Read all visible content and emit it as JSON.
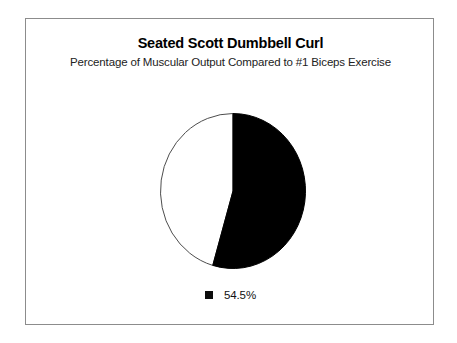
{
  "chart": {
    "title": "Seated Scott Dumbbell Curl",
    "subtitle": "Percentage of Muscular Output Compared to #1 Biceps Exercise",
    "legend_label": "54.5%",
    "legend_swatch_icon": "black-square-icon",
    "frame_border_color": "#8c8c8c",
    "background_color": "#ffffff"
  },
  "chart_data": {
    "type": "pie",
    "title": "Seated Scott Dumbbell Curl",
    "subtitle": "Percentage of Muscular Output Compared to #1 Biceps Exercise",
    "categories": [
      "54.5%",
      "Remainder"
    ],
    "values": [
      54.5,
      45.5
    ],
    "colors": [
      "#000000",
      "#ffffff"
    ],
    "legend": [
      "54.5%"
    ],
    "legend_position": "bottom",
    "start_angle_deg": 0,
    "direction": "clockwise",
    "xlabel": "",
    "ylabel": "",
    "grid": false,
    "annotations": []
  }
}
